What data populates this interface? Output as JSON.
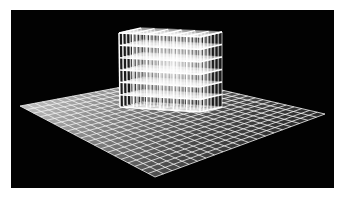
{
  "image": {
    "description": "3D rendering of a white wireframe lattice cube resting on a gridded floor plane against a black background",
    "background_color": "#020202",
    "border_color": "#ffffff",
    "line_color": "#ffffff"
  },
  "scene": {
    "plane": {
      "grid_cells": 20,
      "corners": {
        "left": [
          20,
          106
        ],
        "back": [
          170,
          78
        ],
        "right": [
          325,
          114
        ],
        "front": [
          155,
          177
        ]
      },
      "shade_near": "#c9c9c9",
      "shade_far": "#3a3a3a"
    },
    "cube": {
      "cells_per_side": 6,
      "front_face": {
        "top_left": [
          119,
          33
        ],
        "top_right": [
          200,
          36
        ],
        "bottom_left": [
          120,
          107
        ],
        "bottom_right": [
          200,
          112
        ]
      },
      "side_face": {
        "top_right": [
          222,
          32
        ],
        "bottom_right": [
          222,
          109
        ]
      },
      "top_back": {
        "left": [
          140,
          24
        ],
        "right": [
          222,
          24
        ]
      }
    }
  }
}
